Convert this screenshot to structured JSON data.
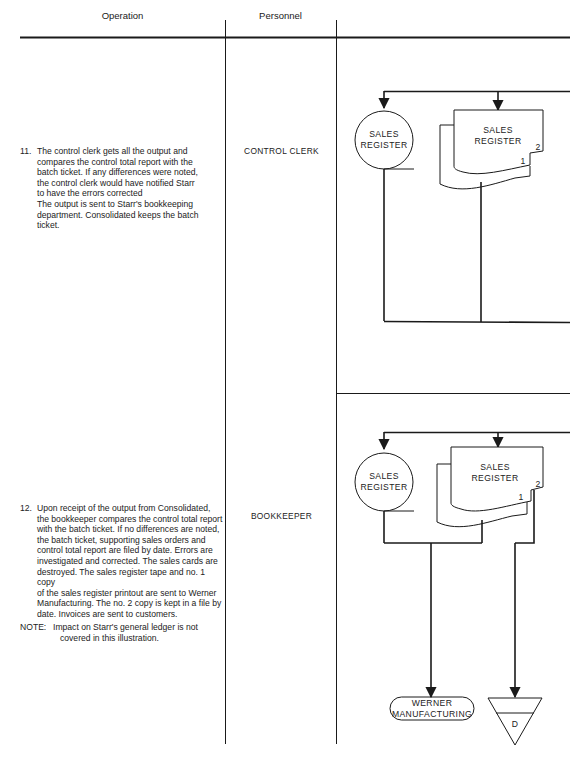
{
  "header": {
    "operation_label": "Operation",
    "personnel_label": "Personnel"
  },
  "steps": [
    {
      "number": "11.",
      "text_lines": [
        "The control clerk gets all the output and",
        "compares the control total report with the",
        "batch ticket.  If any differences were noted,",
        "the control clerk would have notified Starr",
        "to have the errors corrected",
        "The output is sent to Starr's bookkeeping",
        "department.  Consolidated keeps the batch",
        "ticket."
      ],
      "personnel": "CONTROL CLERK",
      "flowchart": {
        "storage_symbol": [
          "SALES",
          "REGISTER"
        ],
        "document_symbol": [
          "SALES",
          "REGISTER"
        ],
        "copy_labels": [
          "1",
          "2"
        ]
      }
    },
    {
      "number": "12.",
      "text_lines": [
        "Upon receipt of the output from Consolidated,",
        "the bookkeeper compares the control total report",
        "with the batch ticket.  If no differences are noted,",
        "the batch ticket, supporting sales orders and",
        "control total report are filed by date.  Errors are",
        "investigated and corrected.  The sales cards are",
        "destroyed.  The sales register tape and no. 1 copy",
        "of the sales register printout are sent to Werner",
        "Manufacturing.  The no. 2 copy is kept in a file by",
        "date.  Invoices are sent to customers."
      ],
      "personnel": "BOOKKEEPER",
      "flowchart": {
        "storage_symbol": [
          "SALES",
          "REGISTER"
        ],
        "document_symbol": [
          "SALES",
          "REGISTER"
        ],
        "copy_labels": [
          "1",
          "2"
        ],
        "terminal_symbol": [
          "WERNER",
          "MANUFACTURING"
        ],
        "file_symbol": "D"
      }
    }
  ],
  "note": {
    "label": "NOTE:",
    "lines": [
      "Impact on Starr's general ledger is not",
      "covered in this illustration."
    ]
  },
  "colors": {
    "line": "#1a1a1a",
    "background": "#ffffff"
  }
}
